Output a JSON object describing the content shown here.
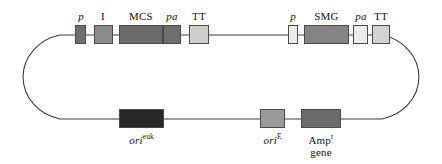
{
  "figure": {
    "name": "expression-vector-plasmid-map",
    "type": "circular-plasmid-diagram",
    "backbone_color": "#3d3d3d",
    "background_color": "#ffffff",
    "outline_shape": "stadium"
  },
  "top_strand": {
    "features": [
      {
        "id": "promoter-1",
        "label": "p",
        "italic": true,
        "fill": "#6e6e6e",
        "x": 75,
        "y": 25,
        "width": 11,
        "height": 19,
        "label_x": 64,
        "label_y": 10,
        "label_width": 34
      },
      {
        "id": "intron",
        "label": "I",
        "italic": false,
        "fill": "#8c8c8c",
        "x": 94,
        "y": 25,
        "width": 19,
        "height": 19,
        "label_x": 86,
        "label_y": 10,
        "label_width": 34
      },
      {
        "id": "multiple-cloning-site",
        "label": "MCS",
        "italic": false,
        "fill": "#6b6b6b",
        "x": 119,
        "y": 25,
        "width": 44,
        "height": 19,
        "label_x": 119,
        "label_y": 10,
        "label_width": 44
      },
      {
        "id": "polyadenylation-1",
        "label": "pa",
        "italic": true,
        "fill": "#6e6e6e",
        "x": 163,
        "y": 25,
        "width": 18,
        "height": 19,
        "label_x": 155,
        "label_y": 10,
        "label_width": 34
      },
      {
        "id": "transcription-terminator-1",
        "label": "TT",
        "italic": false,
        "fill": "#cfcfcf",
        "x": 189,
        "y": 25,
        "width": 20,
        "height": 19,
        "label_x": 182,
        "label_y": 10,
        "label_width": 34
      },
      {
        "id": "promoter-2",
        "label": "p",
        "italic": true,
        "fill": "#ececec",
        "x": 288,
        "y": 25,
        "width": 10,
        "height": 19,
        "label_x": 276,
        "label_y": 10,
        "label_width": 34
      },
      {
        "id": "selectable-marker-gene",
        "label": "SMG",
        "italic": false,
        "fill": "#848484",
        "x": 304,
        "y": 25,
        "width": 45,
        "height": 19,
        "label_x": 304,
        "label_y": 10,
        "label_width": 45
      },
      {
        "id": "polyadenylation-2",
        "label": "pa",
        "italic": true,
        "fill": "#ececec",
        "x": 353,
        "y": 25,
        "width": 15,
        "height": 19,
        "label_x": 345,
        "label_y": 10,
        "label_width": 32
      },
      {
        "id": "transcription-terminator-2",
        "label": "TT",
        "italic": false,
        "fill": "#d2d2d2",
        "x": 372,
        "y": 25,
        "width": 18,
        "height": 19,
        "label_x": 365,
        "label_y": 10,
        "label_width": 32
      }
    ]
  },
  "bottom_strand": {
    "features": [
      {
        "id": "ori-euk",
        "label_main": "ori",
        "label_sup": "euk",
        "label_line2": "",
        "fill": "#282828",
        "x": 119,
        "y": 109,
        "width": 45,
        "height": 19,
        "label_x": 109,
        "label_y": 131,
        "label_width": 65
      },
      {
        "id": "ori-e",
        "label_main": "ori",
        "label_sup": "E",
        "label_line2": "",
        "fill": "#9a9a9a",
        "x": 260,
        "y": 109,
        "width": 25,
        "height": 19,
        "label_x": 250,
        "label_y": 131,
        "label_width": 45
      },
      {
        "id": "amp-resistance-gene",
        "label_main": "Amp",
        "label_sup": "r",
        "label_line2": "gene",
        "fill": "#6b6b6b",
        "x": 301,
        "y": 109,
        "width": 40,
        "height": 19,
        "label_x": 291,
        "label_y": 131,
        "label_width": 60
      }
    ]
  }
}
